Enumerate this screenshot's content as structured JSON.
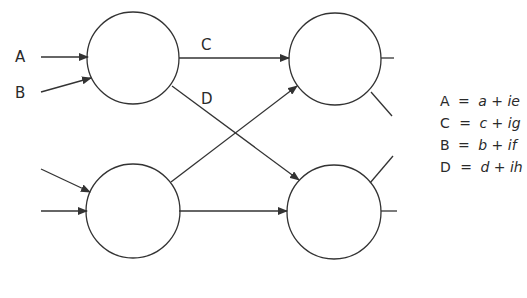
{
  "diagram": {
    "type": "network / butterfly diagram",
    "nodes": [
      {
        "id": "top-left",
        "cx": 133,
        "cy": 58,
        "r": 46
      },
      {
        "id": "top-right",
        "cx": 335,
        "cy": 59,
        "r": 46
      },
      {
        "id": "bottom-left",
        "cx": 133,
        "cy": 211,
        "r": 47
      },
      {
        "id": "bottom-right",
        "cx": 334,
        "cy": 212,
        "r": 47
      }
    ],
    "input_labels": {
      "a": "A",
      "b": "B"
    },
    "edge_labels": {
      "c": "C",
      "d": "D"
    },
    "equations": [
      {
        "lhs": "A",
        "eq": "=",
        "rhs": "a + ie"
      },
      {
        "lhs": "C",
        "eq": "=",
        "rhs": "c + ig"
      },
      {
        "lhs": "B",
        "eq": "=",
        "rhs": "b + if"
      },
      {
        "lhs": "D",
        "eq": "=",
        "rhs": "d + ih"
      }
    ],
    "stroke_color": "#333333"
  }
}
